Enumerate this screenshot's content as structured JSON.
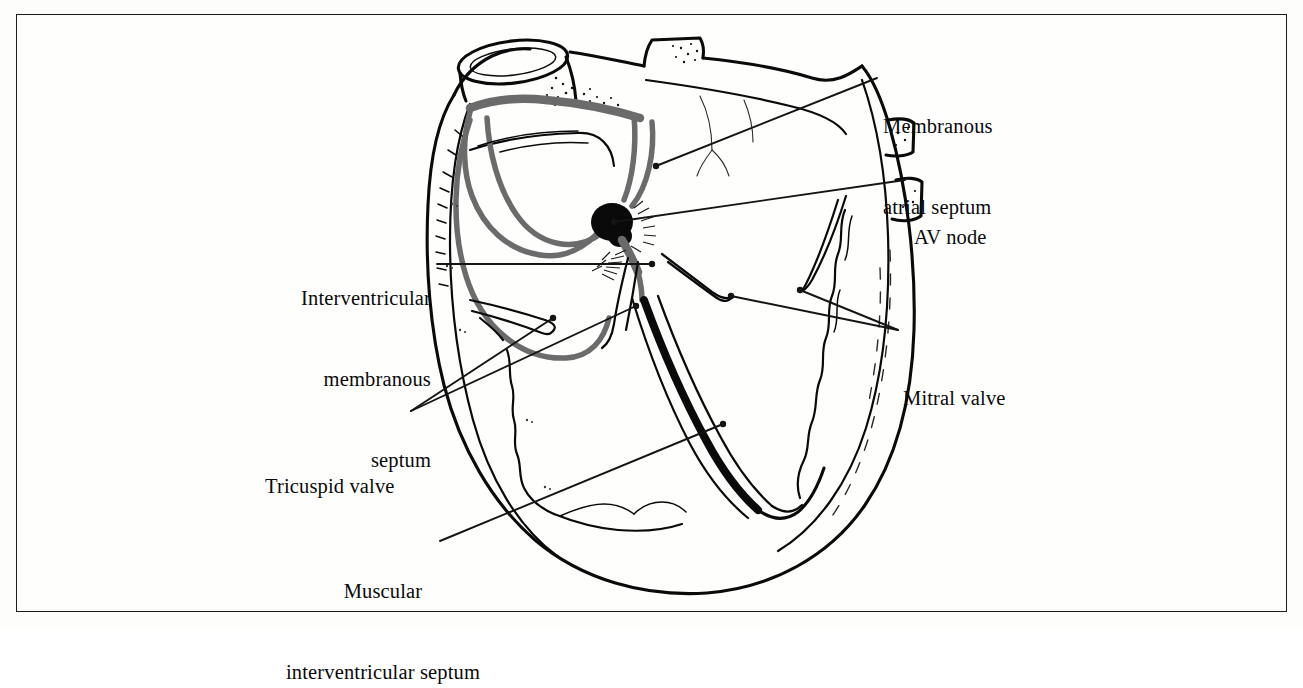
{
  "figure": {
    "kind": "anatomical-line-drawing",
    "border_color": "#1c1c1c",
    "background_color": "#fdfdfc",
    "ink_color": "#0a0a0a",
    "conduction_tract_color": "#6b6b6b",
    "av_node_color": "#0a0a0a"
  },
  "labels": [
    {
      "id": "membranous-atrial-septum",
      "line1": "Membranous",
      "line2": "atrial septum",
      "align": "left",
      "x": 883,
      "y": 59,
      "lines": 2
    },
    {
      "id": "av-node",
      "line1": "AV node",
      "line2": "",
      "align": "left",
      "x": 914,
      "y": 170,
      "lines": 1
    },
    {
      "id": "interventricular-membranous-septum",
      "line1": "Interventricular",
      "line2": "membranous",
      "line3": "septum",
      "align": "right",
      "x": 271,
      "y": 231,
      "lines": 3
    },
    {
      "id": "mitral-valve",
      "line1": "Mitral valve",
      "line2": "",
      "align": "left",
      "x": 903,
      "y": 331,
      "lines": 1
    },
    {
      "id": "tricuspid-valve",
      "line1": "Tricuspid valve",
      "line2": "",
      "align": "left",
      "x": 265,
      "y": 419,
      "lines": 1
    },
    {
      "id": "muscular-interventricular-septum",
      "line1": "Muscular",
      "line2": "interventricular septum",
      "align": "center",
      "x": 264,
      "y": 524,
      "lines": 2
    }
  ],
  "leader_lines": [
    {
      "id": "leader-membranous-atrial-septum",
      "from": [
        877,
        78
      ],
      "to": [
        656,
        166
      ],
      "dot_at": "to"
    },
    {
      "id": "leader-av-node",
      "from": [
        905,
        180
      ],
      "to": [
        614,
        222
      ],
      "dot_at": "to"
    },
    {
      "id": "leader-interventricular-membranous-septum",
      "from": [
        437,
        264
      ],
      "to": [
        652,
        264
      ],
      "dot_at": "to"
    },
    {
      "id": "leader-mitral-valve",
      "from": [
        898,
        330
      ],
      "to": [
        731,
        296
      ],
      "dot_at": "to"
    },
    {
      "id": "leader-mitral-valve-2",
      "from": [
        898,
        330
      ],
      "to": [
        800,
        290
      ],
      "dot_at": "to"
    },
    {
      "id": "leader-tricuspid-valve",
      "from": [
        411,
        411
      ],
      "to": [
        553,
        318
      ],
      "dot_at": "to"
    },
    {
      "id": "leader-tricuspid-valve-2",
      "from": [
        411,
        411
      ],
      "to": [
        636,
        306
      ],
      "dot_at": "to"
    },
    {
      "id": "leader-muscular-interventricular-septum",
      "from": [
        440,
        541
      ],
      "to": [
        723,
        424
      ],
      "dot_at": "to"
    }
  ],
  "anatomy_parts": [
    {
      "id": "superior-vena-cava-orifice",
      "note": "elliptical stump, upper left"
    },
    {
      "id": "pulmonary-vein-stump-top",
      "note": "stippled stump, upper right"
    },
    {
      "id": "right-atrium-chamber",
      "note": "left-hand upper chamber in view"
    },
    {
      "id": "left-atrium-chamber",
      "note": "right-hand upper chamber in view"
    },
    {
      "id": "sa-node-and-internodal-tracts",
      "note": "grey bands looping through atrium"
    },
    {
      "id": "av-node",
      "note": "solid black ovoid at septal junction"
    },
    {
      "id": "bundle-of-his",
      "note": "grey descending bundle below AV node"
    },
    {
      "id": "membranous-septum-hatching",
      "note": "fine hatch marks flanking the bundle"
    },
    {
      "id": "tricuspid-valve-leaflets",
      "note": "leaflets on the left-hand ventricle"
    },
    {
      "id": "mitral-valve-leaflets",
      "note": "leaflets on the right-hand ventricle"
    },
    {
      "id": "muscular-interventricular-septum",
      "note": "thick black central septal band"
    },
    {
      "id": "right-ventricle-chamber",
      "note": "left-hand lower chamber in view"
    },
    {
      "id": "left-ventricle-chamber",
      "note": "right-hand lower chamber in view"
    },
    {
      "id": "ventricular-apex",
      "note": "rounded bottom of the ventricular mass"
    },
    {
      "id": "epicardial-outline",
      "note": "outer heart silhouette"
    }
  ]
}
